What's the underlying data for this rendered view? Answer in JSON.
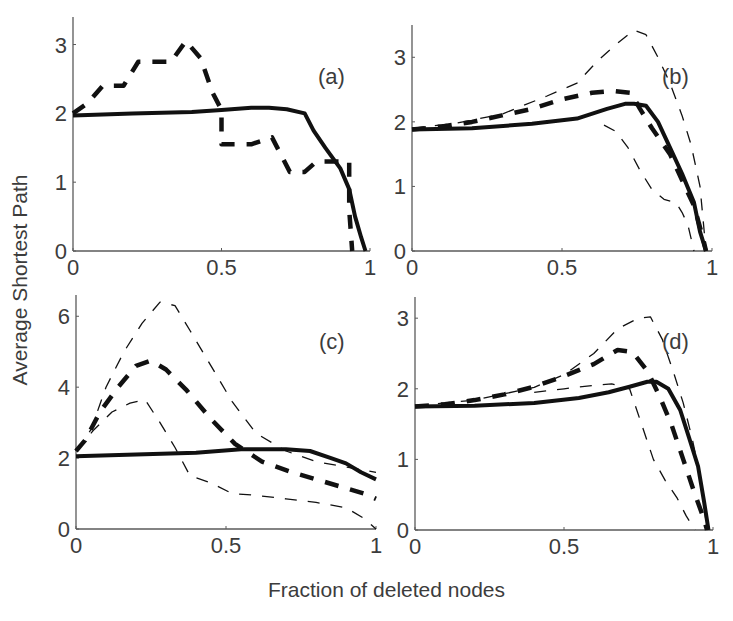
{
  "figure": {
    "ylabel": "Average Shortest Path",
    "xlabel": "Fraction of deleted nodes"
  },
  "chart_data": [
    {
      "type": "line",
      "panel": "(a)",
      "xlabel": "Fraction of deleted nodes",
      "ylabel": "Average Shortest Path",
      "xlim": [
        0,
        1
      ],
      "ylim": [
        0,
        3.4
      ],
      "xticks": [
        "0",
        "0.5",
        "1"
      ],
      "yticks": [
        "0",
        "1",
        "2",
        "3"
      ],
      "grid": false,
      "series": [
        {
          "name": "solid",
          "style": "solid-thick",
          "x": [
            0.0,
            0.2,
            0.4,
            0.5,
            0.6,
            0.66,
            0.72,
            0.78,
            0.81,
            0.85,
            0.9,
            0.93,
            0.95,
            0.97,
            0.985
          ],
          "y": [
            1.97,
            2.0,
            2.02,
            2.05,
            2.08,
            2.08,
            2.06,
            2.0,
            1.75,
            1.5,
            1.2,
            0.9,
            0.5,
            0.2,
            0.0
          ]
        },
        {
          "name": "dashed",
          "style": "dashed-thick",
          "x": [
            0.0,
            0.05,
            0.1,
            0.17,
            0.22,
            0.27,
            0.33,
            0.38,
            0.43,
            0.47,
            0.5,
            0.5,
            0.6,
            0.67,
            0.73,
            0.78,
            0.82,
            0.88,
            0.93,
            0.93,
            0.94
          ],
          "y": [
            2.0,
            2.15,
            2.4,
            2.4,
            2.75,
            2.75,
            2.75,
            3.05,
            2.8,
            2.3,
            2.05,
            1.55,
            1.55,
            1.65,
            1.15,
            1.15,
            1.3,
            1.3,
            1.3,
            0.6,
            0.0
          ]
        }
      ],
      "annotation": "(a)"
    },
    {
      "type": "line",
      "panel": "(b)",
      "xlim": [
        0,
        1
      ],
      "ylim": [
        0,
        3.5
      ],
      "xticks": [
        "0",
        "0.5",
        "1"
      ],
      "yticks": [
        "0",
        "1",
        "2",
        "3"
      ],
      "grid": false,
      "series": [
        {
          "name": "solid",
          "style": "solid-thick",
          "x": [
            0.0,
            0.2,
            0.4,
            0.55,
            0.65,
            0.71,
            0.74,
            0.78,
            0.82,
            0.86,
            0.9,
            0.94,
            0.96,
            0.98
          ],
          "y": [
            1.88,
            1.9,
            1.97,
            2.05,
            2.2,
            2.28,
            2.28,
            2.25,
            2.0,
            1.6,
            1.2,
            0.75,
            0.3,
            0.0
          ]
        },
        {
          "name": "dashed-mean",
          "style": "dashed-thick",
          "x": [
            0.0,
            0.1,
            0.2,
            0.3,
            0.4,
            0.5,
            0.6,
            0.67,
            0.73,
            0.76,
            0.8,
            0.86,
            0.9,
            0.94,
            0.97,
            0.98
          ],
          "y": [
            1.88,
            1.93,
            2.0,
            2.1,
            2.2,
            2.35,
            2.45,
            2.48,
            2.45,
            2.2,
            1.9,
            1.5,
            1.1,
            0.7,
            0.2,
            0.0
          ]
        },
        {
          "name": "dashed-upper",
          "style": "dashed-thin",
          "x": [
            0.0,
            0.15,
            0.3,
            0.45,
            0.55,
            0.62,
            0.68,
            0.74,
            0.78,
            0.82,
            0.86,
            0.9,
            0.93,
            0.96,
            0.98
          ],
          "y": [
            1.9,
            1.98,
            2.12,
            2.4,
            2.6,
            2.95,
            3.2,
            3.42,
            3.35,
            3.0,
            2.6,
            2.1,
            1.65,
            1.0,
            0.0
          ]
        },
        {
          "name": "dashed-lower",
          "style": "dashed-thin",
          "x": [
            0.64,
            0.68,
            0.72,
            0.76,
            0.8,
            0.84,
            0.88,
            0.9,
            0.92,
            0.93,
            0.94
          ],
          "y": [
            1.95,
            1.85,
            1.6,
            1.25,
            0.95,
            0.8,
            0.75,
            0.6,
            0.4,
            0.2,
            0.0
          ]
        }
      ],
      "annotation": "(b)"
    },
    {
      "type": "line",
      "panel": "(c)",
      "xlim": [
        0,
        1
      ],
      "ylim": [
        0,
        6.6
      ],
      "xticks": [
        "0",
        "0.5",
        "1"
      ],
      "yticks": [
        "0",
        "2",
        "4",
        "6"
      ],
      "grid": false,
      "series": [
        {
          "name": "solid",
          "style": "solid-thick",
          "x": [
            0.0,
            0.2,
            0.4,
            0.55,
            0.7,
            0.78,
            0.85,
            0.9,
            0.95,
            1.0
          ],
          "y": [
            2.05,
            2.1,
            2.15,
            2.25,
            2.25,
            2.2,
            2.0,
            1.85,
            1.6,
            1.4
          ]
        },
        {
          "name": "dashed-mean",
          "style": "dashed-thick",
          "x": [
            0.0,
            0.03,
            0.08,
            0.14,
            0.2,
            0.25,
            0.3,
            0.37,
            0.45,
            0.53,
            0.62,
            0.72,
            0.82,
            0.9,
            0.96,
            1.0
          ],
          "y": [
            2.2,
            2.5,
            3.3,
            4.0,
            4.6,
            4.75,
            4.5,
            3.9,
            3.1,
            2.4,
            1.9,
            1.6,
            1.35,
            1.15,
            1.0,
            0.85
          ]
        },
        {
          "name": "dashed-upper",
          "style": "dashed-thin",
          "x": [
            0.0,
            0.05,
            0.1,
            0.16,
            0.22,
            0.28,
            0.33,
            0.38,
            0.45,
            0.52,
            0.6,
            0.7,
            0.8,
            0.9,
            1.0
          ],
          "y": [
            2.2,
            2.8,
            4.0,
            5.0,
            5.8,
            6.4,
            6.3,
            5.6,
            4.6,
            3.6,
            2.7,
            2.2,
            1.9,
            1.75,
            1.6
          ]
        },
        {
          "name": "dashed-lower",
          "style": "dashed-thin",
          "x": [
            0.0,
            0.06,
            0.12,
            0.18,
            0.23,
            0.28,
            0.33,
            0.38,
            0.45,
            0.52,
            0.6,
            0.7,
            0.8,
            0.9,
            0.96,
            1.0
          ],
          "y": [
            2.2,
            2.8,
            3.3,
            3.55,
            3.65,
            3.0,
            2.3,
            1.5,
            1.3,
            1.0,
            0.95,
            0.85,
            0.75,
            0.6,
            0.3,
            0.0
          ]
        }
      ],
      "annotation": "(c)"
    },
    {
      "type": "line",
      "panel": "(d)",
      "xlim": [
        0,
        1
      ],
      "ylim": [
        0,
        3.3
      ],
      "xticks": [
        "0",
        "0.5",
        "1"
      ],
      "yticks": [
        "0",
        "1",
        "2",
        "3"
      ],
      "grid": false,
      "series": [
        {
          "name": "solid",
          "style": "solid-thick",
          "x": [
            0.0,
            0.2,
            0.4,
            0.55,
            0.65,
            0.72,
            0.78,
            0.81,
            0.85,
            0.89,
            0.92,
            0.95,
            0.97,
            0.985
          ],
          "y": [
            1.75,
            1.76,
            1.8,
            1.87,
            1.95,
            2.03,
            2.1,
            2.1,
            2.0,
            1.7,
            1.3,
            0.9,
            0.4,
            0.0
          ]
        },
        {
          "name": "dashed-mean",
          "style": "dashed-thick",
          "x": [
            0.0,
            0.1,
            0.2,
            0.3,
            0.4,
            0.5,
            0.6,
            0.68,
            0.73,
            0.78,
            0.82,
            0.86,
            0.9,
            0.94,
            0.97,
            0.98
          ],
          "y": [
            1.75,
            1.78,
            1.84,
            1.92,
            2.03,
            2.18,
            2.35,
            2.55,
            2.52,
            2.25,
            1.9,
            1.5,
            1.0,
            0.5,
            0.15,
            0.0
          ]
        },
        {
          "name": "dashed-upper",
          "style": "dashed-thin",
          "x": [
            0.0,
            0.2,
            0.4,
            0.5,
            0.6,
            0.68,
            0.75,
            0.79,
            0.83,
            0.87,
            0.9,
            0.93,
            0.96,
            0.98
          ],
          "y": [
            1.76,
            1.84,
            2.02,
            2.2,
            2.5,
            2.85,
            3.0,
            3.02,
            2.7,
            2.2,
            1.8,
            1.3,
            0.7,
            0.0
          ]
        },
        {
          "name": "dashed-lower",
          "style": "dashed-thin",
          "x": [
            0.4,
            0.5,
            0.6,
            0.66,
            0.72,
            0.76,
            0.8,
            0.84,
            0.88,
            0.91,
            0.94
          ],
          "y": [
            1.95,
            2.0,
            2.05,
            2.07,
            2.0,
            1.5,
            1.0,
            0.7,
            0.45,
            0.2,
            0.0
          ]
        }
      ],
      "annotation": "(d)"
    }
  ],
  "panels_layout": [
    {
      "x0": 73,
      "x1": 370,
      "y0": 251,
      "ytop": 17
    },
    {
      "x0": 412,
      "x1": 712,
      "y0": 251,
      "ytop": 25
    },
    {
      "x0": 76,
      "x1": 376,
      "y0": 529,
      "ytop": 295
    },
    {
      "x0": 415,
      "x1": 713,
      "y0": 530,
      "ytop": 297
    }
  ],
  "annotation_positions": [
    {
      "x": 318,
      "y": 84
    },
    {
      "x": 662,
      "y": 84
    },
    {
      "x": 319,
      "y": 349
    },
    {
      "x": 662,
      "y": 349
    }
  ],
  "colors": {
    "axis": "#5a5a5a",
    "line": "#111111",
    "text": "#3c3c3c",
    "background": "#ffffff"
  }
}
